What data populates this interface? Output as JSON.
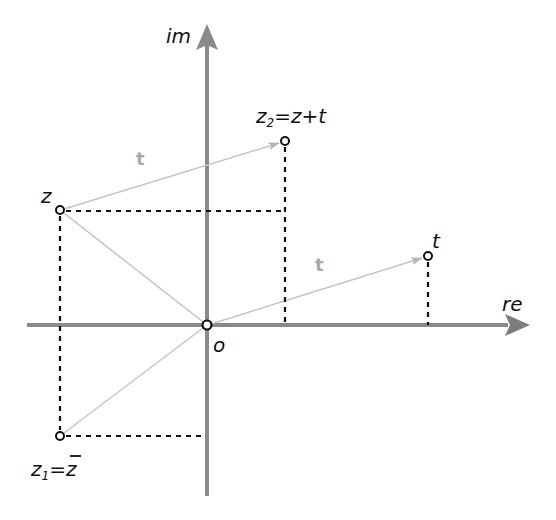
{
  "diagram": {
    "axes": {
      "horizontal_label": "re",
      "vertical_label": "im",
      "color": "#8a8a8a"
    },
    "origin": {
      "label": "o"
    },
    "points": {
      "z": {
        "label": "z"
      },
      "z2": {
        "label_main": "z",
        "label_sub": "2",
        "label_rest": "=z+t"
      },
      "t": {
        "label": "t"
      },
      "z1": {
        "label_main": "z",
        "label_sub": "1",
        "label_eq": "=",
        "label_conj": "z"
      }
    },
    "vectors": [
      {
        "label": "t",
        "from": "z",
        "to": "z2"
      },
      {
        "label": "t",
        "from": "o",
        "to": "t"
      }
    ],
    "colors": {
      "vector": "#c4c4c4",
      "vector_label": "#a8a8a8",
      "dashed": "#111111",
      "point_stroke": "#111111"
    }
  }
}
